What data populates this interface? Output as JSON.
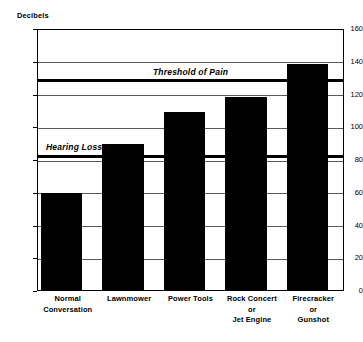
{
  "chart_data": {
    "type": "bar",
    "title": "",
    "subtitle": "",
    "xlabel": "",
    "ylabel": "Decibels",
    "ylim": [
      0,
      160
    ],
    "ytick_step": 20,
    "yticks": [
      0,
      20,
      40,
      60,
      80,
      100,
      120,
      140,
      160
    ],
    "grid": true,
    "legend": "none",
    "bar_color": "#000000",
    "categories": [
      "Normal\nConversation",
      "Lawnmower",
      "Power Tools",
      "Rock Concert\nor\nJet Engine",
      "Firecracker\nor\nGunshot"
    ],
    "category_lines": [
      [
        "Normal",
        "Conversation"
      ],
      [
        "Lawnmower"
      ],
      [
        "Power Tools"
      ],
      [
        "Rock Concert",
        "or",
        "Jet Engine"
      ],
      [
        "Firecracker",
        "or",
        "Gunshot"
      ]
    ],
    "values": [
      59,
      89,
      109,
      118,
      138
    ],
    "annotations": [
      {
        "label": "Threshold of Pain",
        "value": 129,
        "style": "thick-black-line"
      },
      {
        "label": "Hearing Loss",
        "value": 83,
        "style": "thick-black-line"
      }
    ]
  },
  "axis": {
    "y_title": "Decibels",
    "tick_labels": [
      "160",
      "140",
      "120",
      "100",
      "80",
      "60",
      "40",
      "20",
      "0"
    ]
  },
  "reference_lines": {
    "pain_label": "Threshold of Pain",
    "hearing_label": "Hearing Loss"
  }
}
